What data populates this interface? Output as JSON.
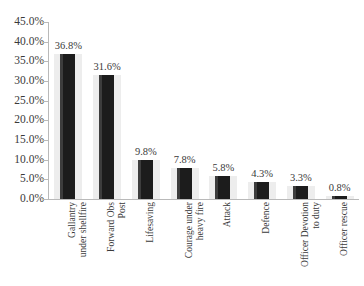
{
  "chart_data": {
    "type": "bar",
    "title": "",
    "xlabel": "",
    "ylabel": "",
    "ylim": [
      0,
      45
    ],
    "grid": false,
    "legend": "none",
    "value_suffix": "%",
    "categories": [
      "Gallantry\nunder shellfire",
      "Forward Obs\nPost",
      "Lifesaving",
      "Courage under\nheavy fire",
      "Attack",
      "Defence",
      "Officer Devotion\nto duty",
      "Officer rescue"
    ],
    "values": [
      36.8,
      31.6,
      9.8,
      7.8,
      5.8,
      4.3,
      3.3,
      0.8
    ],
    "data_labels": [
      "36.8%",
      "31.6%",
      "9.8%",
      "7.8%",
      "5.8%",
      "4.3%",
      "3.3%",
      "0.8%"
    ],
    "ytick_values": [
      45.0,
      40.0,
      35.0,
      30.0,
      25.0,
      20.0,
      15.0,
      10.0,
      5.0,
      0.0
    ],
    "ytick_labels": [
      "45.0%",
      "40.0%",
      "35.0%",
      "30.0%",
      "25.0%",
      "20.0%",
      "15.0%",
      "10.0%",
      "5.0%",
      "0.0%"
    ],
    "colors": {
      "bar": "#1c1c1c",
      "bar_band": "#ededed",
      "bar_highlight": "#3d3d3d",
      "axis": "#b9b9b9",
      "text": "#3a3a3a",
      "background": "#ffffff"
    }
  }
}
